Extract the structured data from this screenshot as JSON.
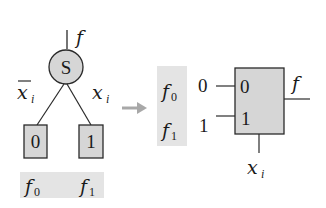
{
  "colors": {
    "stroke": "#2a2a2a",
    "node_fill": "#d6d6d6",
    "band_fill": "#e4e4e4",
    "arrow": "#a8a8a8",
    "text": "#1a1a1a"
  },
  "tree": {
    "output_label": "f",
    "root_node": "S",
    "left_edge_label": "x",
    "left_edge_sub": "i",
    "right_edge_label": "x",
    "right_edge_sub": "i",
    "leaf_left": "0",
    "leaf_right": "1",
    "leaf_left_fn": "f",
    "leaf_left_fn_sub": "0",
    "leaf_right_fn": "f",
    "leaf_right_fn_sub": "1"
  },
  "mux": {
    "input0_fn": "f",
    "input0_fn_sub": "0",
    "input1_fn": "f",
    "input1_fn_sub": "1",
    "input0_value": "0",
    "input1_value": "1",
    "port0_label": "0",
    "port1_label": "1",
    "output_label": "f",
    "select_label": "x",
    "select_sub": "i"
  }
}
